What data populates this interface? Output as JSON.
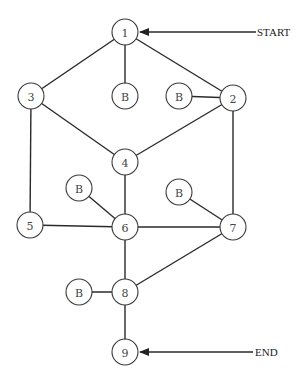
{
  "diagram": {
    "type": "flow-graph",
    "node_radius": 13,
    "colors": {
      "stroke": "#2a2a2a",
      "fill": "#ffffff",
      "text": "#444444"
    },
    "nodes": [
      {
        "id": "n1",
        "label": "1",
        "x": 125,
        "y": 32
      },
      {
        "id": "n2",
        "label": "2",
        "x": 233,
        "y": 98
      },
      {
        "id": "n3",
        "label": "3",
        "x": 31,
        "y": 96
      },
      {
        "id": "n4",
        "label": "4",
        "x": 125,
        "y": 162
      },
      {
        "id": "n5",
        "label": "5",
        "x": 30,
        "y": 225
      },
      {
        "id": "n6",
        "label": "6",
        "x": 125,
        "y": 227
      },
      {
        "id": "n7",
        "label": "7",
        "x": 233,
        "y": 227
      },
      {
        "id": "n8",
        "label": "8",
        "x": 125,
        "y": 292
      },
      {
        "id": "n9",
        "label": "9",
        "x": 125,
        "y": 352
      },
      {
        "id": "b1",
        "label": "B",
        "x": 125,
        "y": 96
      },
      {
        "id": "b2",
        "label": "B",
        "x": 179,
        "y": 96
      },
      {
        "id": "b3",
        "label": "B",
        "x": 79,
        "y": 188
      },
      {
        "id": "b4",
        "label": "B",
        "x": 179,
        "y": 192
      },
      {
        "id": "b5",
        "label": "B",
        "x": 79,
        "y": 292
      }
    ],
    "edges": [
      [
        "n1",
        "n3"
      ],
      [
        "n1",
        "b1"
      ],
      [
        "n1",
        "n2"
      ],
      [
        "b2",
        "n2"
      ],
      [
        "n3",
        "n4"
      ],
      [
        "n2",
        "n4"
      ],
      [
        "n3",
        "n5"
      ],
      [
        "n2",
        "n7"
      ],
      [
        "n4",
        "n6"
      ],
      [
        "b3",
        "n6"
      ],
      [
        "b4",
        "n7"
      ],
      [
        "n5",
        "n6"
      ],
      [
        "n6",
        "n7"
      ],
      [
        "n6",
        "n8"
      ],
      [
        "n7",
        "n8"
      ],
      [
        "b5",
        "n8"
      ],
      [
        "n8",
        "n9"
      ]
    ],
    "start": {
      "label": "START",
      "target": "n1"
    },
    "end": {
      "label": "END",
      "target": "n9"
    }
  }
}
